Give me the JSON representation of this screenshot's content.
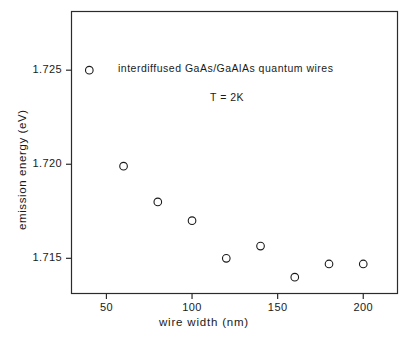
{
  "chart_data": {
    "type": "scatter",
    "title": "",
    "annotations": [
      {
        "text": "interdiffused GaAs/GaAlAs quantum wires",
        "x": 118,
        "y": 62
      },
      {
        "text": "T = 2K",
        "x": 210,
        "y": 91
      }
    ],
    "xlabel": "wire width (nm)",
    "ylabel": "emission energy (eV)",
    "xlim": [
      29.6,
      220.0
    ],
    "ylim": [
      1.71313,
      1.72812
    ],
    "xticks": [
      50,
      100,
      150,
      200
    ],
    "xticklabels": [
      "50",
      "100",
      "150",
      "200"
    ],
    "yticks": [
      1.715,
      1.72,
      1.725
    ],
    "yticklabels": [
      "1.715",
      "1.720",
      "1.725"
    ],
    "grid": false,
    "legend": null,
    "marker": "open-circle",
    "marker_size": 5,
    "series": [
      {
        "name": "emission energy vs wire width",
        "x": [
          40,
          60,
          80,
          100,
          120,
          140,
          160,
          180,
          200
        ],
        "y": [
          1.725,
          1.7199,
          1.718,
          1.717,
          1.715,
          1.71565,
          1.714,
          1.7147,
          1.7147
        ]
      }
    ]
  },
  "figure": {
    "frame_color": "#2b2b2b",
    "marker_color": "#1a1a1a",
    "background": "#ffffff"
  }
}
